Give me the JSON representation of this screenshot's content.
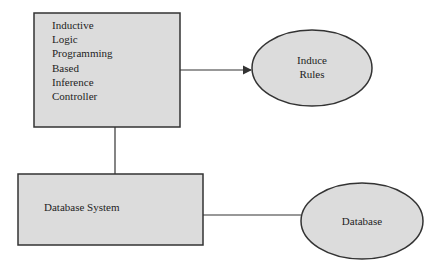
{
  "diagram": {
    "nodes": [
      {
        "id": "ilp_controller",
        "shape": "rectangle",
        "lines": [
          "Inductive",
          "Logic",
          "Programming",
          "Based",
          "Inference",
          "Controller"
        ]
      },
      {
        "id": "induce_rules",
        "shape": "ellipse",
        "lines": [
          "Induce",
          "Rules"
        ]
      },
      {
        "id": "database_system",
        "shape": "rectangle",
        "label": "Database System"
      },
      {
        "id": "database",
        "shape": "ellipse",
        "label": "Database"
      }
    ],
    "edges": [
      {
        "from": "ilp_controller",
        "to": "induce_rules",
        "type": "arrow"
      },
      {
        "from": "ilp_controller",
        "to": "database_system",
        "type": "line"
      },
      {
        "from": "database_system",
        "to": "database",
        "type": "line"
      }
    ],
    "colors": {
      "fill": "#dcdcdc",
      "stroke": "#333333",
      "background": "#ffffff"
    }
  }
}
